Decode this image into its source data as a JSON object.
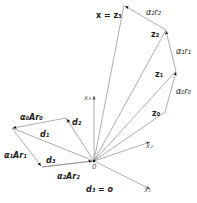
{
  "diagram": {
    "origin_label": "0",
    "axes": [
      {
        "id": "x1",
        "label": "x₁"
      },
      {
        "id": "x2",
        "label": "x₂"
      },
      {
        "id": "x3",
        "label": "x₃"
      }
    ],
    "z_vectors": [
      {
        "id": "z0",
        "label": "z₀"
      },
      {
        "id": "z1",
        "label": "z₁"
      },
      {
        "id": "z2",
        "label": "z₂"
      },
      {
        "id": "z3",
        "label": "x = z₃"
      }
    ],
    "r_steps": [
      {
        "id": "a0r0",
        "label": "α₀r₀"
      },
      {
        "id": "a1r1",
        "label": "α₁r₁"
      },
      {
        "id": "a2r2",
        "label": "α₂r₂"
      }
    ],
    "d_vectors": [
      {
        "id": "d1",
        "label": "d₁"
      },
      {
        "id": "d2",
        "label": "d₂"
      },
      {
        "id": "d3",
        "label": "d₃"
      },
      {
        "id": "d3zero",
        "label": "d₃ = o"
      }
    ],
    "Ar_steps": [
      {
        "id": "a0Ar0",
        "label": "α₀Ar₀"
      },
      {
        "id": "a1Ar1",
        "label": "α₁Ar₁"
      },
      {
        "id": "a2Ar2",
        "label": "α₂Ar₂"
      }
    ]
  }
}
